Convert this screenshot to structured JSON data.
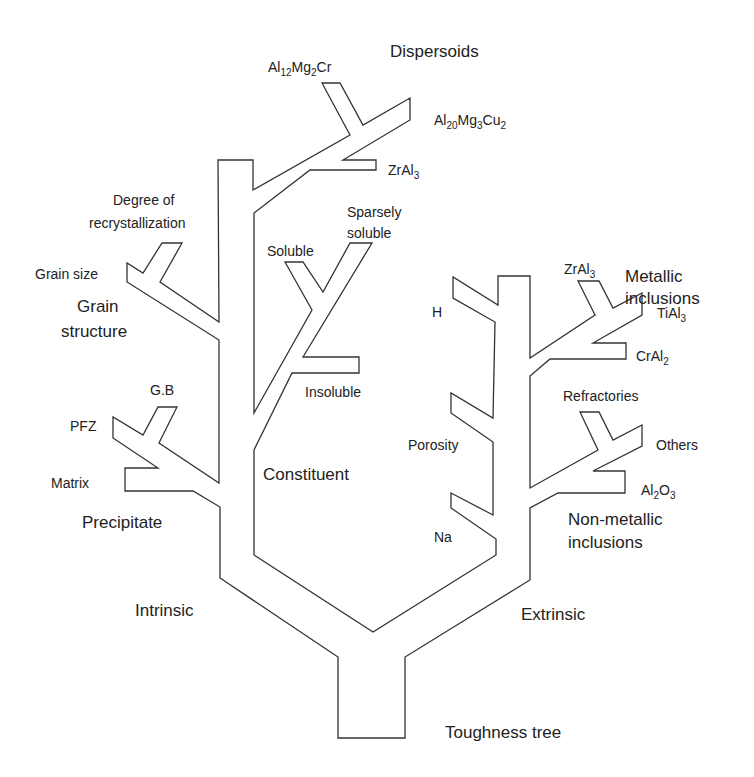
{
  "diagram": {
    "title": "Toughness tree",
    "colors": {
      "line": "#333333",
      "text": "#222222",
      "background": "#ffffff"
    },
    "root": "Toughness tree",
    "branches": {
      "intrinsic": {
        "label": "Intrinsic",
        "children": {
          "dispersoids": {
            "label": "Dispersoids",
            "items": [
              {
                "base": "Al",
                "sub1": "12",
                "mid": "Mg",
                "sub2": "2",
                "end": "Cr"
              },
              {
                "base": "Al",
                "sub1": "20",
                "mid": "Mg",
                "sub2": "3",
                "end": "Cu",
                "sub3": "2"
              },
              {
                "base": "ZrAl",
                "sub1": "3"
              }
            ]
          },
          "grain_structure": {
            "label_line1": "Grain",
            "label_line2": "structure",
            "items": [
              "Degree of",
              "recrystallization",
              "Grain size"
            ]
          },
          "constituent": {
            "label": "Constituent",
            "items": [
              "Soluble",
              "Sparsely",
              "soluble",
              "Insoluble"
            ]
          },
          "precipitate": {
            "label": "Precipitate",
            "items": [
              "G.B",
              "PFZ",
              "Matrix"
            ]
          }
        }
      },
      "extrinsic": {
        "label": "Extrinsic",
        "children": {
          "metallic_inclusions": {
            "label_line1": "Metallic",
            "label_line2": "inclusions",
            "items": [
              {
                "base": "ZrAl",
                "sub": "3"
              },
              {
                "base": "TiAl",
                "sub": "3"
              },
              {
                "base": "CrAl",
                "sub": "2"
              }
            ]
          },
          "porosity": {
            "label": "Porosity",
            "items": [
              "H",
              "Na"
            ]
          },
          "non_metallic_inclusions": {
            "label_line1": "Non-metallic",
            "label_line2": "inclusions",
            "items": [
              "Refractories",
              "Others",
              {
                "a": "Al",
                "s1": "2",
                "b": "O",
                "s2": "3"
              }
            ]
          }
        }
      }
    }
  }
}
